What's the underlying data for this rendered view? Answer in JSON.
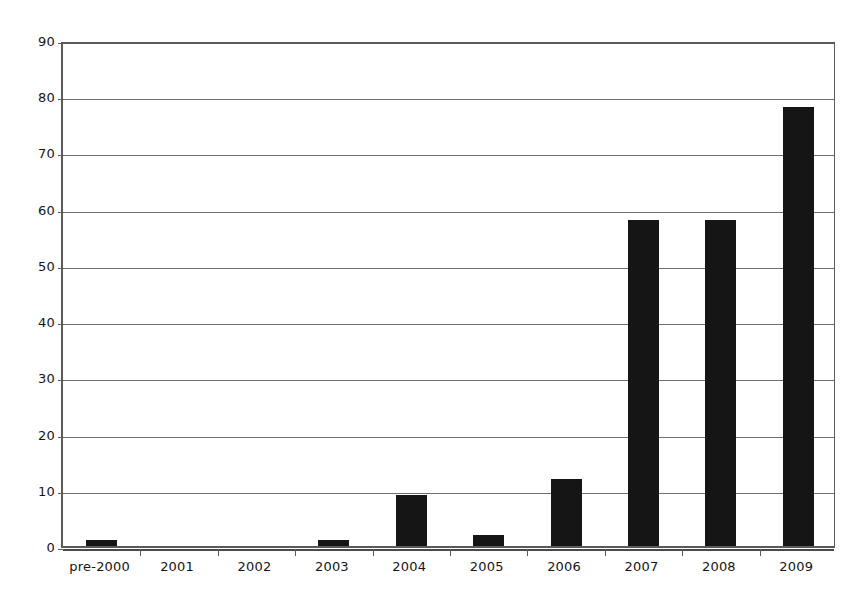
{
  "chart_data": {
    "type": "bar",
    "title": "",
    "subtitle": "",
    "xlabel": "",
    "ylabel": "",
    "categories": [
      "pre-2000",
      "2001",
      "2002",
      "2003",
      "2004",
      "2005",
      "2006",
      "2007",
      "2008",
      "2009"
    ],
    "values": [
      1,
      0,
      0,
      1,
      9,
      2,
      12,
      58,
      58,
      78
    ],
    "series": [
      {
        "name": "",
        "values": [
          1,
          0,
          0,
          1,
          9,
          2,
          12,
          58,
          58,
          78
        ]
      }
    ],
    "ylim": [
      0,
      90
    ],
    "ytick_values": [
      0,
      10,
      20,
      30,
      40,
      50,
      60,
      70,
      80,
      90
    ],
    "ytick_labels": [
      "0",
      "10",
      "20",
      "30",
      "40",
      "50",
      "60",
      "70",
      "80",
      "90"
    ],
    "grid": true,
    "grid_axis": "y",
    "legend": false,
    "legend_position": "none",
    "bar_color": "#151515",
    "grid_color": "#6f6f6f",
    "axis_color": "#5a5a5a",
    "background_color": "#ffffff",
    "annotations": []
  }
}
